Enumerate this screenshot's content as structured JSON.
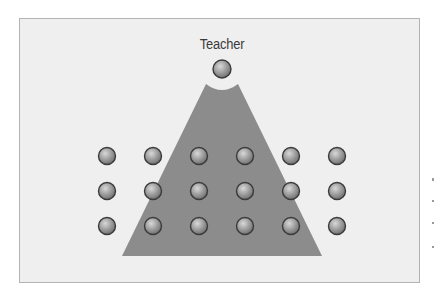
{
  "diagram": {
    "title_label": "Teacher",
    "colors": {
      "background": "#efefef",
      "frame_border": "#b3b3b3",
      "triangle_fill": "#8c8c8c",
      "student_fill": "#9e9e9e",
      "student_outline": "#3a3a3a"
    },
    "teacher": {
      "cx": 222,
      "cy": 69,
      "r": 9
    },
    "triangle": {
      "apex_left": [
        206,
        84
      ],
      "apex_right": [
        238,
        84
      ],
      "base_left": [
        122,
        256
      ],
      "base_right": [
        322,
        256
      ]
    },
    "students": {
      "columns_x": [
        107,
        153,
        199,
        245,
        291,
        337
      ],
      "rows_y": [
        156,
        191,
        226
      ],
      "r": 8.5
    }
  }
}
